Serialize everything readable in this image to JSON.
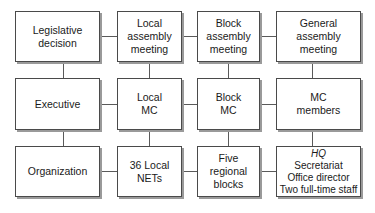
{
  "diagram": {
    "rows": [
      {
        "name": "legislative",
        "cells": [
          {
            "lines": [
              "Legislative",
              "decision"
            ]
          },
          {
            "lines": [
              "Local",
              "assembly",
              "meeting"
            ]
          },
          {
            "lines": [
              "Block",
              "assembly",
              "meeting"
            ]
          },
          {
            "lines": [
              "General",
              "assembly",
              "meeting"
            ]
          }
        ]
      },
      {
        "name": "executive",
        "cells": [
          {
            "lines": [
              "Executive"
            ]
          },
          {
            "lines": [
              "Local",
              "MC"
            ]
          },
          {
            "lines": [
              "Block",
              "MC"
            ]
          },
          {
            "lines": [
              "MC",
              "members"
            ]
          }
        ]
      },
      {
        "name": "organization",
        "cells": [
          {
            "lines": [
              "Organization"
            ]
          },
          {
            "lines": [
              "36 Local",
              "NETs"
            ]
          },
          {
            "lines": [
              "Five",
              "regional",
              "blocks"
            ]
          },
          {
            "lines": [
              "HQ",
              "Secretariat",
              "Office director",
              "Two full-time staff"
            ]
          }
        ]
      }
    ],
    "colors": {
      "border": "#4a4a4a",
      "shadow": "#9a9a9a",
      "connector": "#5a5a5a",
      "background": "#ffffff"
    }
  }
}
